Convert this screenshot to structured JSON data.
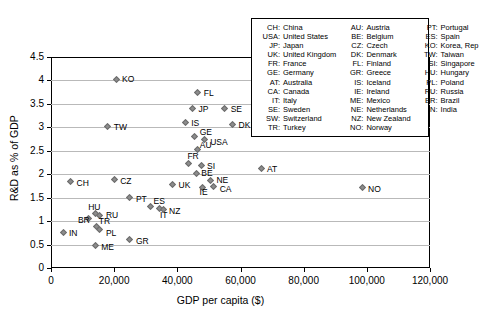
{
  "chart_data": {
    "type": "scatter",
    "title": "",
    "xlabel": "GDP per capita ($)",
    "ylabel": "R&D as % of GDP",
    "xlim": [
      0,
      120000
    ],
    "ylim": [
      0,
      4.5
    ],
    "xticks": [
      "0",
      "20,000",
      "40,000",
      "60,000",
      "80,000",
      "100,000",
      "120,000"
    ],
    "xtick_values": [
      0,
      20000,
      40000,
      60000,
      80000,
      100000,
      120000
    ],
    "yticks": [
      "0",
      "0.5",
      "1",
      "1.5",
      "2",
      "2.5",
      "3",
      "3.5",
      "4",
      "4.5"
    ],
    "ytick_values": [
      0,
      0.5,
      1,
      1.5,
      2,
      2.5,
      3,
      3.5,
      4,
      4.5
    ],
    "grid": "horizontal",
    "legend_position": "top-right",
    "marker": "diamond",
    "marker_color": "#8c8c8c",
    "points": [
      {
        "code": "KO",
        "x": 20600,
        "y": 4.03,
        "lx": 6,
        "ly": -4
      },
      {
        "code": "FL",
        "x": 46500,
        "y": 3.74,
        "lx": 6,
        "ly": -4
      },
      {
        "code": "JP",
        "x": 44800,
        "y": 3.4,
        "lx": 6,
        "ly": -4
      },
      {
        "code": "SE",
        "x": 55000,
        "y": 3.4,
        "lx": 6,
        "ly": -4
      },
      {
        "code": "IS",
        "x": 42500,
        "y": 3.1,
        "lx": 6,
        "ly": -4
      },
      {
        "code": "TW",
        "x": 18000,
        "y": 3.01,
        "lx": 6,
        "ly": -4
      },
      {
        "code": "SW",
        "x": 75000,
        "y": 3.01,
        "lx": 6,
        "ly": -4
      },
      {
        "code": "DK",
        "x": 57500,
        "y": 3.05,
        "lx": 6,
        "ly": -4
      },
      {
        "code": "GE",
        "x": 45500,
        "y": 2.8,
        "lx": 5,
        "ly": -9
      },
      {
        "code": "USA",
        "x": 48500,
        "y": 2.73,
        "lx": 6,
        "ly": -2
      },
      {
        "code": "AU",
        "x": 46500,
        "y": 2.52,
        "lx": 2,
        "ly": -9
      },
      {
        "code": "FR",
        "x": 43500,
        "y": 2.23,
        "lx": -1,
        "ly": -11
      },
      {
        "code": "SI",
        "x": 47500,
        "y": 2.19,
        "lx": 6,
        "ly": -3
      },
      {
        "code": "AT",
        "x": 66500,
        "y": 2.13,
        "lx": 6,
        "ly": -3
      },
      {
        "code": "BE",
        "x": 46000,
        "y": 2.02,
        "lx": 5,
        "ly": -4
      },
      {
        "code": "NE",
        "x": 50500,
        "y": 1.86,
        "lx": 6,
        "ly": -5
      },
      {
        "code": "CA",
        "x": 51500,
        "y": 1.73,
        "lx": 6,
        "ly": -2
      },
      {
        "code": "IE",
        "x": 48000,
        "y": 1.72,
        "lx": -3,
        "ly": 1
      },
      {
        "code": "UK",
        "x": 38500,
        "y": 1.78,
        "lx": 6,
        "ly": -4
      },
      {
        "code": "CH",
        "x": 6200,
        "y": 1.84,
        "lx": 6,
        "ly": -3
      },
      {
        "code": "CZ",
        "x": 20000,
        "y": 1.88,
        "lx": 6,
        "ly": -3
      },
      {
        "code": "NO",
        "x": 98500,
        "y": 1.71,
        "lx": 6,
        "ly": -3
      },
      {
        "code": "PT",
        "x": 25000,
        "y": 1.5,
        "lx": 6,
        "ly": -3
      },
      {
        "code": "ES",
        "x": 31500,
        "y": 1.32,
        "lx": 3,
        "ly": -9
      },
      {
        "code": "IT",
        "x": 34500,
        "y": 1.26,
        "lx": 0,
        "ly": 2
      },
      {
        "code": "NZ",
        "x": 35500,
        "y": 1.25,
        "lx": 6,
        "ly": -2
      },
      {
        "code": "HU",
        "x": 14000,
        "y": 1.16,
        "lx": -7,
        "ly": -11
      },
      {
        "code": "RU",
        "x": 15500,
        "y": 1.12,
        "lx": 6,
        "ly": -4
      },
      {
        "code": "BR",
        "x": 12000,
        "y": 1.05,
        "lx": -11,
        "ly": -3
      },
      {
        "code": "TR",
        "x": 14500,
        "y": 0.89,
        "lx": 2,
        "ly": -9
      },
      {
        "code": "PL",
        "x": 15500,
        "y": 0.83,
        "lx": 6,
        "ly": 0
      },
      {
        "code": "IN",
        "x": 3800,
        "y": 0.76,
        "lx": 6,
        "ly": -3
      },
      {
        "code": "GR",
        "x": 25000,
        "y": 0.6,
        "lx": 6,
        "ly": -3
      },
      {
        "code": "ME",
        "x": 14000,
        "y": 0.49,
        "lx": 6,
        "ly": -2
      }
    ]
  },
  "legend": {
    "columns": [
      [
        {
          "abbr": "CH",
          "name": "China"
        },
        {
          "abbr": "USA",
          "name": "United States"
        },
        {
          "abbr": "JP",
          "name": "Japan"
        },
        {
          "abbr": "UK",
          "name": "United Kingdom"
        },
        {
          "abbr": "FR",
          "name": "France"
        },
        {
          "abbr": "GE",
          "name": "Germany"
        },
        {
          "abbr": "AT",
          "name": "Australia"
        },
        {
          "abbr": "CA",
          "name": "Canada"
        },
        {
          "abbr": "IT",
          "name": "Italy"
        },
        {
          "abbr": "SE",
          "name": "Sweden"
        },
        {
          "abbr": "SW",
          "name": "Switzerland"
        },
        {
          "abbr": "TR",
          "name": "Turkey"
        }
      ],
      [
        {
          "abbr": "AU",
          "name": "Austria"
        },
        {
          "abbr": "BE",
          "name": "Belgium"
        },
        {
          "abbr": "CZ",
          "name": "Czech"
        },
        {
          "abbr": "DK",
          "name": "Denmark"
        },
        {
          "abbr": "FL",
          "name": "Finland"
        },
        {
          "abbr": "GR",
          "name": "Greece"
        },
        {
          "abbr": "IS",
          "name": "Iceland"
        },
        {
          "abbr": "IE",
          "name": "Ireland"
        },
        {
          "abbr": "ME",
          "name": "Mexico"
        },
        {
          "abbr": "NE",
          "name": "Netherlands"
        },
        {
          "abbr": "NZ",
          "name": "New Zealand"
        },
        {
          "abbr": "NO",
          "name": "Norway"
        }
      ],
      [
        {
          "abbr": "PT",
          "name": "Portugal"
        },
        {
          "abbr": "ES",
          "name": "Spain"
        },
        {
          "abbr": "KO",
          "name": "Korea, Rep"
        },
        {
          "abbr": "TW",
          "name": "Taiwan"
        },
        {
          "abbr": "SI",
          "name": "Singapore"
        },
        {
          "abbr": "HU",
          "name": "Hungary"
        },
        {
          "abbr": "PL",
          "name": "Poland"
        },
        {
          "abbr": "RU",
          "name": "Russia"
        },
        {
          "abbr": "BR",
          "name": "Brazil"
        },
        {
          "abbr": "IN",
          "name": "India"
        }
      ]
    ]
  }
}
